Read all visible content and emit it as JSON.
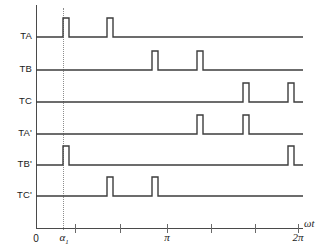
{
  "chart_data": {
    "type": "line",
    "title": "",
    "xlabel": "ωt",
    "ylabel": "",
    "xlim": [
      0,
      6.283185
    ],
    "grid": false,
    "legend": "none",
    "x_ticks": [
      {
        "value": 0,
        "label": "0",
        "pixel_x": 36
      },
      {
        "value": 1.047,
        "label": "",
        "pixel_x": 75
      },
      {
        "value": 1.571,
        "label": "",
        "pixel_x": 120
      },
      {
        "value": 3.142,
        "label": "π",
        "pixel_x": 167
      },
      {
        "value": 4.189,
        "label": "",
        "pixel_x": 211
      },
      {
        "value": 5.236,
        "label": "",
        "pixel_x": 255
      },
      {
        "value": 6.283,
        "label": "2π",
        "pixel_x": 298
      }
    ],
    "marker_lines": [
      {
        "name": "alpha-1",
        "label": "α",
        "sublabel": "1",
        "pixel_x": 63,
        "style": "dotted"
      }
    ],
    "series": [
      {
        "name": "TA",
        "label": "TA",
        "baseline_y": 37,
        "pulse_height": 19,
        "pulses": [
          {
            "start_px": 63,
            "end_px": 69
          },
          {
            "start_px": 107,
            "end_px": 113
          }
        ]
      },
      {
        "name": "TB",
        "label": "TB",
        "baseline_y": 70,
        "pulse_height": 19,
        "pulses": [
          {
            "start_px": 152,
            "end_px": 158
          },
          {
            "start_px": 197,
            "end_px": 203
          }
        ]
      },
      {
        "name": "TC",
        "label": "TC",
        "baseline_y": 102,
        "pulse_height": 19,
        "pulses": [
          {
            "start_px": 243,
            "end_px": 249
          },
          {
            "start_px": 288,
            "end_px": 294
          }
        ]
      },
      {
        "name": "TA'",
        "label": "TA'",
        "baseline_y": 134,
        "pulse_height": 19,
        "pulses": [
          {
            "start_px": 197,
            "end_px": 203
          },
          {
            "start_px": 243,
            "end_px": 249
          }
        ]
      },
      {
        "name": "TB'",
        "label": "TB'",
        "baseline_y": 165,
        "pulse_height": 19,
        "pulses": [
          {
            "start_px": 63,
            "end_px": 69
          },
          {
            "start_px": 288,
            "end_px": 294
          }
        ]
      },
      {
        "name": "TC'",
        "label": "TC'",
        "baseline_y": 196,
        "pulse_height": 19,
        "pulses": [
          {
            "start_px": 107,
            "end_px": 113
          },
          {
            "start_px": 152,
            "end_px": 158
          }
        ]
      }
    ]
  },
  "axes": {
    "vertical_axis_x": 36,
    "vertical_axis_top": 5,
    "horizontal_axis_y": 228,
    "horizontal_axis_right": 303,
    "axis_color": "#4a4a4a",
    "trace_color": "#3d3d3d",
    "marker_color": "#8d8d8d"
  },
  "labels": {
    "zero": "0",
    "alpha": "α",
    "alpha_sub": "1",
    "pi": "π",
    "two_pi": "2π",
    "omega_t": "ωt"
  }
}
